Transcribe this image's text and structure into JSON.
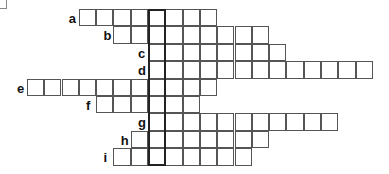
{
  "puzzle": {
    "type": "crossword",
    "key_column_index": 0,
    "cell_size_px": 17.3,
    "key_column_left_px": 148,
    "rows": [
      {
        "label": "a",
        "before": 4,
        "after": 3
      },
      {
        "label": "b",
        "before": 2,
        "after": 6
      },
      {
        "label": "c",
        "before": 0,
        "after": 7
      },
      {
        "label": "d",
        "before": 0,
        "after": 12
      },
      {
        "label": "e",
        "before": 7,
        "after": 3
      },
      {
        "label": "f",
        "before": 3,
        "after": 2
      },
      {
        "label": "g",
        "before": 0,
        "after": 10
      },
      {
        "label": "h",
        "before": 1,
        "after": 6
      },
      {
        "label": "i",
        "before": 2,
        "after": 5
      }
    ]
  }
}
